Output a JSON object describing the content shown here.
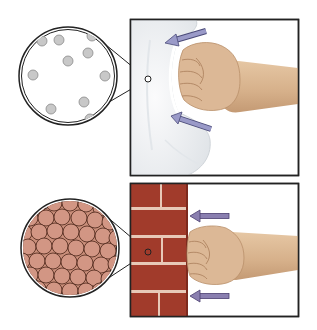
{
  "figure": {
    "panels": [
      {
        "id": "pillow",
        "subject": "pillow",
        "magnifier": {
          "center": [
            68,
            76
          ],
          "radius": 49,
          "fill": "#ffffff",
          "particle_color": "#c8c8c8",
          "particle_outline": "#8a8a8a",
          "particle_radius": 5,
          "particles": [
            [
              42,
              41
            ],
            [
              59,
              40
            ],
            [
              92,
              36
            ],
            [
              88,
              53
            ],
            [
              68,
              61
            ],
            [
              33,
              75
            ],
            [
              105,
              76
            ],
            [
              51,
              109
            ],
            [
              84,
              102
            ],
            [
              90,
              119
            ]
          ],
          "focus_point": [
            148,
            79
          ]
        },
        "frame": {
          "x": 130,
          "y": 19,
          "w": 169,
          "h": 157
        },
        "material_color": "#eef0f2",
        "arrows": [
          {
            "from": [
              206,
              31
            ],
            "to": [
              166,
              42
            ],
            "color": "#8f8fb8"
          },
          {
            "from": [
              211,
              129
            ],
            "to": [
              172,
              116
            ],
            "color": "#8f8fb8"
          }
        ]
      },
      {
        "id": "brick",
        "subject": "brick wall",
        "magnifier": {
          "center": [
            70,
            248
          ],
          "radius": 49,
          "fill": "#c98e7a",
          "particle_color": "#d29684",
          "particle_outline": "#4a2418",
          "particle_radius": 8,
          "focus_point": [
            148,
            252
          ]
        },
        "frame": {
          "x": 130,
          "y": 183,
          "w": 169,
          "h": 134
        },
        "material_color": "#a13b2b",
        "mortar_color": "#e8c9b8",
        "arrows": [
          {
            "from": [
              229,
              216
            ],
            "to": [
              190,
              216
            ],
            "color": "#8a7fb0"
          },
          {
            "from": [
              229,
              296
            ],
            "to": [
              190,
              296
            ],
            "color": "#8a7fb0"
          }
        ]
      }
    ],
    "skin_color": "#dcb896",
    "skin_shadow": "#b98f6a",
    "frame_color": "#222222"
  }
}
